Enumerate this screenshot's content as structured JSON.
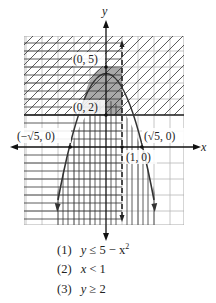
{
  "figure": {
    "axes": {
      "x_label": "x",
      "y_label": "y"
    },
    "points": [
      {
        "label": "(0, 5)",
        "x": 0,
        "y": 5
      },
      {
        "label": "(0, 2)",
        "x": 0,
        "y": 2
      },
      {
        "label": "(−√5, 0)",
        "x": -2.236,
        "y": 0
      },
      {
        "label": "(√5, 0)",
        "x": 2.236,
        "y": 0
      },
      {
        "label": "(1, 0)",
        "x": 1,
        "y": 0
      }
    ],
    "curves": [
      {
        "name": "parabola",
        "equation": "y = 5 - x^2",
        "style": "solid"
      },
      {
        "name": "vertical-line",
        "equation": "x = 1",
        "style": "dashed"
      },
      {
        "name": "horizontal-line",
        "equation": "y = 2",
        "style": "solid"
      }
    ],
    "shading": [
      {
        "inequality": "y ≤ 5 − x²",
        "pattern": "vertical lines"
      },
      {
        "inequality": "x < 1",
        "pattern": "horizontal lines"
      },
      {
        "inequality": "y ≥ 2",
        "pattern": "diagonal lines"
      }
    ],
    "solution_region": {
      "fill": "#9a9a9a",
      "description": "gray region inside parabola, above y=2, left of x=1"
    },
    "grid": {
      "x_range": [
        -5,
        5
      ],
      "y_range": [
        -5,
        7
      ],
      "unit": 1
    }
  },
  "inequalities": [
    {
      "num": "(1)",
      "lhs": "y",
      "op": "≤",
      "rhs": "5 − x",
      "sup": "2"
    },
    {
      "num": "(2)",
      "lhs": "x",
      "op": "<",
      "rhs": "1",
      "sup": ""
    },
    {
      "num": "(3)",
      "lhs": "y",
      "op": "≥",
      "rhs": "2",
      "sup": ""
    }
  ]
}
